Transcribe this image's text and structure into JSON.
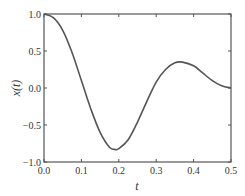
{
  "chart_data": {
    "type": "line",
    "title": "",
    "xlabel": "t",
    "ylabel": "x(t)",
    "xlim": [
      0.0,
      0.5
    ],
    "ylim": [
      -1.0,
      1.0
    ],
    "grid": false,
    "legend": null,
    "xticks": [
      "0.0",
      "0.1",
      "0.2",
      "0.3",
      "0.4",
      "0.5"
    ],
    "yticks": [
      "-1.0",
      "-0.5",
      "0.0",
      "0.5",
      "1.0"
    ],
    "series": [
      {
        "name": "x(t)",
        "color": "#555555",
        "x": [
          0.0,
          0.025,
          0.05,
          0.075,
          0.1,
          0.125,
          0.15,
          0.175,
          0.19,
          0.2,
          0.225,
          0.25,
          0.275,
          0.3,
          0.325,
          0.35,
          0.37,
          0.4,
          0.425,
          0.45,
          0.475,
          0.5
        ],
        "y": [
          1.0,
          0.95,
          0.78,
          0.48,
          0.1,
          -0.28,
          -0.6,
          -0.8,
          -0.83,
          -0.82,
          -0.7,
          -0.46,
          -0.18,
          0.08,
          0.25,
          0.34,
          0.35,
          0.3,
          0.2,
          0.1,
          0.03,
          0.0
        ]
      }
    ]
  }
}
